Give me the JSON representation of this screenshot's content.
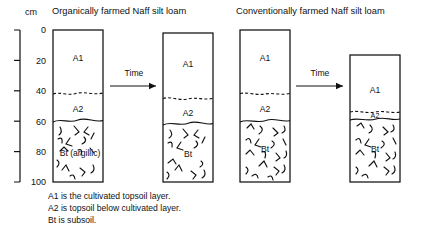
{
  "axis": {
    "unit_label": "cm",
    "ticks": [
      "0",
      "20",
      "40",
      "60",
      "80",
      "100"
    ],
    "min_cm": 0,
    "max_cm": 100,
    "tick_step_cm": 20
  },
  "panels": [
    {
      "title": "Organically farmed Naff silt loam",
      "arrow_label": "Time",
      "columns": [
        {
          "state": "before",
          "surface_cm": 0,
          "bottom_cm": 100,
          "horizons": [
            {
              "code": "A1",
              "label": "A1",
              "top_cm": 0,
              "bottom_cm": 42
            },
            {
              "code": "A2",
              "label": "A2",
              "top_cm": 42,
              "bottom_cm": 60
            },
            {
              "code": "Bt",
              "label": "Bt (argillic)",
              "top_cm": 60,
              "bottom_cm": 100
            }
          ]
        },
        {
          "state": "after",
          "surface_cm": 2,
          "bottom_cm": 100,
          "horizons": [
            {
              "code": "A1",
              "label": "A1",
              "top_cm": 2,
              "bottom_cm": 45
            },
            {
              "code": "A2",
              "label": "A2",
              "top_cm": 45,
              "bottom_cm": 62
            },
            {
              "code": "Bt",
              "label": "Bt",
              "top_cm": 62,
              "bottom_cm": 100
            }
          ]
        }
      ]
    },
    {
      "title": "Conventionally farmed Naff silt loam",
      "arrow_label": "Time",
      "columns": [
        {
          "state": "before",
          "surface_cm": 0,
          "bottom_cm": 100,
          "horizons": [
            {
              "code": "A1",
              "label": "A1",
              "top_cm": 0,
              "bottom_cm": 42
            },
            {
              "code": "A2",
              "label": "A2",
              "top_cm": 42,
              "bottom_cm": 60
            },
            {
              "code": "Bt",
              "label": "Bt",
              "top_cm": 60,
              "bottom_cm": 100
            }
          ]
        },
        {
          "state": "after",
          "surface_cm": 16,
          "bottom_cm": 100,
          "horizons": [
            {
              "code": "A1",
              "label": "A1",
              "top_cm": 16,
              "bottom_cm": 54
            },
            {
              "code": "A2",
              "label": "A2",
              "top_cm": 54,
              "bottom_cm": 58
            },
            {
              "code": "Bt",
              "label": "Bt",
              "top_cm": 58,
              "bottom_cm": 100
            }
          ]
        }
      ]
    }
  ],
  "caption": [
    "A1 is the cultivated topsoil layer.",
    "A2 is topsoil below cultivated layer.",
    "Bt is subsoil."
  ],
  "colors": {
    "ink": "#111111",
    "paper": "#ffffff"
  }
}
